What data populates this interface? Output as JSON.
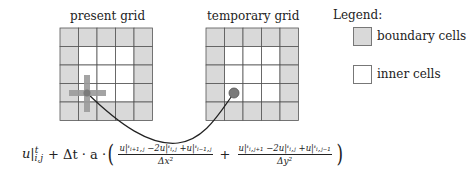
{
  "grids": [
    {
      "title": "present grid",
      "x": 60,
      "y": 28,
      "cols": 5,
      "rows": 5,
      "cell": 18.5,
      "marker": {
        "type": "cross-stencil",
        "col": 1,
        "row": 3
      }
    },
    {
      "title": "temporary grid",
      "x": 206,
      "y": 28,
      "cols": 5,
      "rows": 5,
      "cell": 18.5,
      "marker": {
        "type": "dot",
        "col": 1,
        "row": 3
      }
    }
  ],
  "legend": {
    "title": "Legend:",
    "items": [
      {
        "label": "boundary cells",
        "color": "#d9d9d9"
      },
      {
        "label": "inner cells",
        "color": "#ffffff"
      }
    ]
  },
  "colors": {
    "boundary": "#d9d9d9",
    "inner": "#ffffff",
    "grid_line": "#555555",
    "stencil": "#9a9a9a",
    "dot": "#7a7a7a",
    "arrow": "#222222"
  },
  "formula": {
    "lhs": "u|",
    "lhs_sup": "t",
    "lhs_sub": "i,j",
    "plus_dt": "+ Δt · a ·",
    "frac1_num": "u|ᵗᵢ₊₁,ⱼ −2u|ᵗᵢ,ⱼ +u|ᵗᵢ₋₁,ⱼ",
    "frac1_den": "Δx²",
    "plus": "+",
    "frac2_num": "u|ᵗᵢ,ⱼ₊₁ −2u|ᵗᵢ,ⱼ +u|ᵗᵢ,ⱼ₋₁",
    "frac2_den": "Δy²",
    "open_paren": "(",
    "close_paren": ")"
  }
}
